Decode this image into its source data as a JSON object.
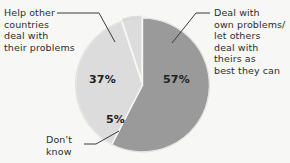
{
  "chart_data": {
    "type": "pie",
    "title": "",
    "subtitle": "",
    "xlabel": "",
    "ylabel": "",
    "legend_position": "none",
    "grid": false,
    "units": "percent",
    "categories": [
      "Deal with own problems/ let others deal with theirs as best they can",
      "Help other countries deal with their problems",
      "Don't know"
    ],
    "values": [
      57,
      37,
      5
    ],
    "labels": [
      "57%",
      "37%",
      "5%"
    ],
    "colors": [
      "#9a9a9a",
      "#dcdcdc",
      "#dcdcdc"
    ],
    "slices": [
      {
        "name": "deal-own-problems",
        "value": 57,
        "label": "57%",
        "color": "#9a9a9a",
        "callout": "Deal with\nown problems/\nlet others\ndeal with\ntheirs as\nbest they can",
        "exploded": false
      },
      {
        "name": "help-other-countries",
        "value": 37,
        "label": "37%",
        "color": "#dcdcdc",
        "callout": "Help other\ncountries\ndeal with\ntheir problems",
        "exploded": false
      },
      {
        "name": "dont-know",
        "value": 5,
        "label": "5%",
        "color": "#dcdcdc",
        "callout": "Don't\nknow",
        "exploded": true
      }
    ],
    "start_angle_deg": 0,
    "direction": "clockwise"
  },
  "callouts": {
    "help_other": "Help other\ncountries\ndeal with\ntheir problems",
    "deal_own": "Deal with\nown problems/\nlet others\ndeal with\ntheirs as\nbest they can",
    "dont_know": "Don't\nknow"
  },
  "percent_labels": {
    "help_other": "37%",
    "deal_own": "57%",
    "dont_know": "5%"
  },
  "colors": {
    "background": "#f7f7f5",
    "slice_dark": "#9a9a9a",
    "slice_light": "#dcdcdc",
    "separator": "#f7f7f5",
    "text": "#2e2e2e",
    "leader_line": "#3a3a3a"
  }
}
